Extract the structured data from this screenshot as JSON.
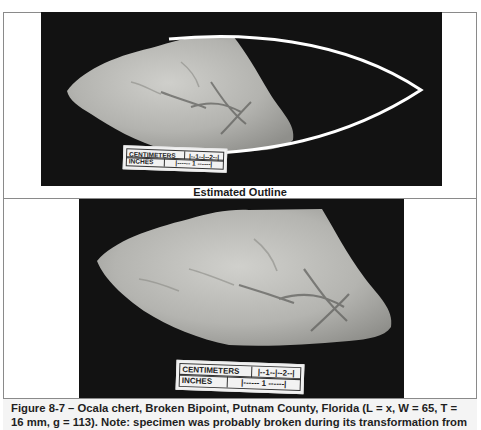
{
  "figure": {
    "top_panel": {
      "label": "Estimated Outline",
      "scale_bar": {
        "row1_label": "CENTIMETERS",
        "row1_ticks": "|--1--|--2--|",
        "row2_label": "INCHES",
        "row2_ticks": "|------ 1 ------|"
      }
    },
    "bottom_panel": {
      "scale_bar": {
        "row1_label": "CENTIMETERS",
        "row1_ticks": "|--1--|--2--|",
        "row2_label": "INCHES",
        "row2_ticks": "|------ 1 ------|"
      }
    },
    "caption": "Figure 8-7 – Ocala chert, Broken Bipoint, Putnam County, Florida (L = x, W = 65, T = 16 mm, g = 113). Note: specimen was probably broken during its transformation from state to bipoint.",
    "colors": {
      "photo_background": "#121212",
      "stone": "#b9b9b6",
      "outline_stroke": "#ffffff",
      "frame_border": "#8a8a8a"
    }
  }
}
